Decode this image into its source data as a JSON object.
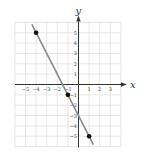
{
  "chart_data": {
    "type": "line",
    "title": "",
    "xlabel": "x",
    "ylabel": "y",
    "xlim": [
      -6,
      4
    ],
    "ylim": [
      -6,
      6
    ],
    "grid": true,
    "x_ticks": [
      -5,
      -4,
      -3,
      -2,
      -1,
      1,
      2,
      3
    ],
    "y_ticks": [
      5,
      4,
      3,
      2,
      1,
      -1,
      -2,
      -3,
      -4,
      -5
    ],
    "series": [
      {
        "name": "y = -2x - 3",
        "type": "line",
        "x": [
          -4.4,
          1.4
        ],
        "y": [
          5.8,
          -5.8
        ],
        "color": "#8a8a8a"
      },
      {
        "name": "points",
        "type": "scatter",
        "x": [
          -4,
          -1,
          1
        ],
        "y": [
          5,
          -1,
          -5
        ],
        "color": "#111111"
      }
    ]
  },
  "colors": {
    "grid": "#dcdcdc",
    "axis": "#333333",
    "line": "#8a8a8a",
    "point": "#111111"
  }
}
